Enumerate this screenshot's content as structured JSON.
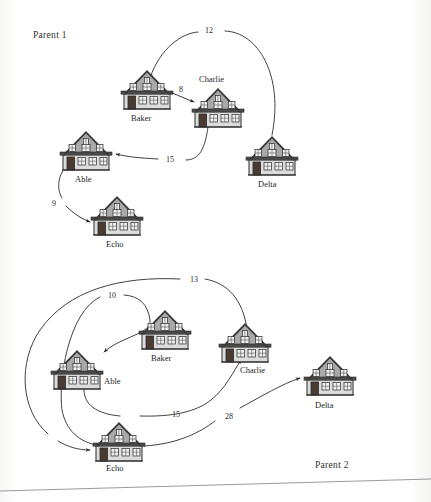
{
  "document": {
    "type": "scanned-figure",
    "background_color": "#fdfdfc",
    "ink_color": "#2b2b2b"
  },
  "sections": [
    {
      "id": "parent-1",
      "label": "Parent 1",
      "x": 33,
      "y": 30
    },
    {
      "id": "parent-2",
      "label": "Parent 2",
      "x": 315,
      "y": 460
    }
  ],
  "graph_1": {
    "name": "Parent 1",
    "nodes": [
      {
        "id": "baker",
        "label": "Baker",
        "x": 147,
        "y": 92,
        "label_pos": "below"
      },
      {
        "id": "charlie",
        "label": "Charlie",
        "x": 218,
        "y": 110,
        "label_pos": "above"
      },
      {
        "id": "delta",
        "label": "Delta",
        "x": 272,
        "y": 158,
        "label_pos": "below"
      },
      {
        "id": "able",
        "label": "Able",
        "x": 86,
        "y": 153,
        "label_pos": "below"
      },
      {
        "id": "echo",
        "label": "Echo",
        "x": 117,
        "y": 218,
        "label_pos": "below"
      }
    ],
    "edges": [
      {
        "from": "delta",
        "to": "baker",
        "weight": "12",
        "label_x": 208,
        "label_y": 29
      },
      {
        "from": "baker",
        "to": "charlie",
        "weight": "8",
        "label_x": 180,
        "label_y": 88
      },
      {
        "from": "charlie",
        "to": "able",
        "weight": "15",
        "label_x": 167,
        "label_y": 157
      },
      {
        "from": "able",
        "to": "echo",
        "weight": "9",
        "label_x": 53,
        "label_y": 201
      }
    ]
  },
  "graph_2": {
    "name": "Parent 2",
    "nodes": [
      {
        "id": "able",
        "label": "Able",
        "x": 77,
        "y": 372,
        "label_pos": "right"
      },
      {
        "id": "baker",
        "label": "Baker",
        "x": 165,
        "y": 332,
        "label_pos": "below"
      },
      {
        "id": "charlie",
        "label": "Charlie",
        "x": 245,
        "y": 345,
        "label_pos": "below-right"
      },
      {
        "id": "delta",
        "label": "Delta",
        "x": 330,
        "y": 378,
        "label_pos": "below"
      },
      {
        "id": "echo",
        "label": "Echo",
        "x": 119,
        "y": 444,
        "label_pos": "below"
      }
    ],
    "edges": [
      {
        "from": "charlie",
        "to": "echo",
        "weight": "13",
        "label_x": 192,
        "label_y": 278
      },
      {
        "from": "echo",
        "to": "able",
        "weight": "10",
        "label_x": 110,
        "label_y": 294
      },
      {
        "from": "able",
        "to": "charlie",
        "weight": "15",
        "label_x": 174,
        "label_y": 412
      },
      {
        "from": "echo",
        "to": "delta",
        "weight": "28",
        "label_x": 227,
        "label_y": 414
      }
    ]
  },
  "page_edge": {
    "visible": true,
    "description": "slanted scanned page border near bottom"
  }
}
